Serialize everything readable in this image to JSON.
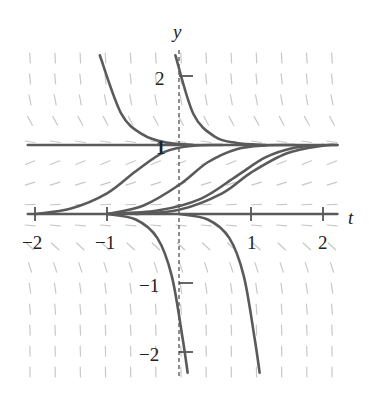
{
  "chart_data": {
    "type": "line",
    "subtype": "slope-field",
    "title": "",
    "xlabel": "t",
    "ylabel": "y",
    "xlim": [
      -2.1,
      2.2
    ],
    "ylim": [
      -2.3,
      2.35
    ],
    "grid": false,
    "legend": null,
    "x_ticks": [
      -2,
      -1,
      1,
      2
    ],
    "x_tick_labels": [
      "−2",
      "−1",
      "1",
      "2"
    ],
    "y_ticks": [
      -2,
      -1,
      1,
      2
    ],
    "y_tick_labels": [
      "−2",
      "−1",
      "1",
      "2"
    ],
    "equilibria": [
      0,
      1
    ],
    "slope_field": {
      "description": "dy/dt = f(y); negative above y=1, positive for 0<y<1, negative for y<0",
      "columns": 13,
      "rows": 16
    },
    "series": [
      {
        "name": "equilibrium y=1",
        "points": [
          [
            -2.1,
            1
          ],
          [
            2.2,
            1
          ]
        ]
      },
      {
        "name": "equilibrium y=0",
        "points": [
          [
            -2.1,
            0
          ],
          [
            2.2,
            0
          ]
        ]
      },
      {
        "name": "above-1 curve A",
        "points": [
          [
            -1.1,
            2.3
          ],
          [
            -0.8,
            1.45
          ],
          [
            -0.5,
            1.15
          ],
          [
            -0.2,
            1.04
          ],
          [
            0.2,
            1.0
          ]
        ]
      },
      {
        "name": "above-1 curve B",
        "points": [
          [
            -0.05,
            2.3
          ],
          [
            0.2,
            1.45
          ],
          [
            0.5,
            1.12
          ],
          [
            0.8,
            1.03
          ],
          [
            1.2,
            1.0
          ]
        ]
      },
      {
        "name": "rising curve 1",
        "points": [
          [
            -2.0,
            0.0
          ],
          [
            -1.5,
            0.08
          ],
          [
            -1.0,
            0.3
          ],
          [
            -0.6,
            0.62
          ],
          [
            -0.2,
            0.9
          ],
          [
            0.2,
            0.99
          ],
          [
            0.6,
            1.0
          ]
        ]
      },
      {
        "name": "rising curve 2",
        "points": [
          [
            -1.0,
            0.0
          ],
          [
            -0.5,
            0.12
          ],
          [
            0.0,
            0.42
          ],
          [
            0.4,
            0.75
          ],
          [
            0.8,
            0.94
          ],
          [
            1.2,
            0.995
          ],
          [
            1.6,
            1.0
          ]
        ]
      },
      {
        "name": "rising curve 3",
        "points": [
          [
            -1.0,
            0.0
          ],
          [
            -0.3,
            0.05
          ],
          [
            0.3,
            0.22
          ],
          [
            0.8,
            0.55
          ],
          [
            1.2,
            0.82
          ],
          [
            1.6,
            0.96
          ],
          [
            2.0,
            1.0
          ]
        ]
      },
      {
        "name": "rising curve 4",
        "points": [
          [
            -0.6,
            0.0
          ],
          [
            0.0,
            0.06
          ],
          [
            0.6,
            0.3
          ],
          [
            1.0,
            0.6
          ],
          [
            1.5,
            0.88
          ],
          [
            2.0,
            0.99
          ],
          [
            2.2,
            1.0
          ]
        ]
      },
      {
        "name": "falling curve A",
        "points": [
          [
            -1.0,
            0.0
          ],
          [
            -0.6,
            -0.08
          ],
          [
            -0.3,
            -0.35
          ],
          [
            -0.1,
            -0.9
          ],
          [
            0.05,
            -1.8
          ],
          [
            0.12,
            -2.3
          ]
        ]
      },
      {
        "name": "falling curve B",
        "points": [
          [
            0.0,
            0.0
          ],
          [
            0.4,
            -0.08
          ],
          [
            0.7,
            -0.35
          ],
          [
            0.9,
            -0.9
          ],
          [
            1.05,
            -1.8
          ],
          [
            1.12,
            -2.3
          ]
        ]
      }
    ]
  },
  "labels": {
    "x_axis": "t",
    "y_axis": "y",
    "x_ticks": [
      "−2",
      "−1",
      "1",
      "2"
    ],
    "y_ticks": [
      "2",
      "1",
      "−1",
      "−2"
    ]
  }
}
